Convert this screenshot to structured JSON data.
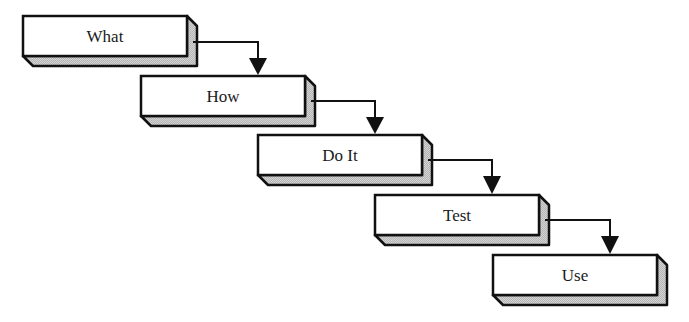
{
  "diagram": {
    "type": "waterfall-process",
    "colors": {
      "stroke": "#111111",
      "face": "#ffffff",
      "depth": "#c9c9c9",
      "text": "#1a1a1a"
    },
    "steps": [
      {
        "label": "What",
        "x": 23,
        "y": 16
      },
      {
        "label": "How",
        "x": 141,
        "y": 76
      },
      {
        "label": "Do It",
        "x": 258,
        "y": 135
      },
      {
        "label": "Test",
        "x": 375,
        "y": 195
      },
      {
        "label": "Use",
        "x": 493,
        "y": 255
      }
    ],
    "box": {
      "width": 164,
      "height": 40,
      "depth": 10
    },
    "arrows": [
      {
        "from": "What",
        "to": "How"
      },
      {
        "from": "How",
        "to": "Do It"
      },
      {
        "from": "Do It",
        "to": "Test"
      },
      {
        "from": "Test",
        "to": "Use"
      }
    ]
  }
}
